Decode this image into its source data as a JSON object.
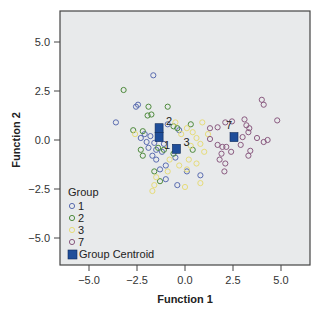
{
  "chart_data": {
    "type": "scatter",
    "title": "",
    "xlabel": "Function 1",
    "ylabel": "Function 2",
    "xlim": [
      -6.5,
      6.5
    ],
    "ylim": [
      -6.5,
      6.5
    ],
    "xticks": [
      -5.0,
      -2.5,
      0.0,
      2.5,
      5.0
    ],
    "yticks": [
      -5.0,
      -2.5,
      0.0,
      2.5,
      5.0
    ],
    "xtick_labels": [
      "−5.0",
      "−2.5",
      "0.0",
      "2.5",
      "5.0"
    ],
    "ytick_labels": [
      "−5.0",
      "−2.5",
      "0.0",
      "2.5",
      "5.0"
    ],
    "grid": false,
    "plot_background": "#e8eaeb",
    "legend": {
      "title": "Group",
      "position": "lower-left-inside",
      "entries": [
        {
          "label": "1",
          "color": "#5a6cb0",
          "marker": "open-circle"
        },
        {
          "label": "2",
          "color": "#4e8a3c",
          "marker": "open-circle"
        },
        {
          "label": "3",
          "color": "#e6dc7a",
          "marker": "open-circle"
        },
        {
          "label": "7",
          "color": "#8a5a80",
          "marker": "open-circle"
        },
        {
          "label": "Group Centroid",
          "color": "#1f4e9a",
          "marker": "filled-square"
        }
      ]
    },
    "series": [
      {
        "name": "1",
        "color": "#5a6cb0",
        "points": [
          [
            -1.65,
            3.3
          ],
          [
            -2.45,
            1.8
          ],
          [
            -2.55,
            1.7
          ],
          [
            -3.6,
            0.9
          ],
          [
            -2.1,
            0.3
          ],
          [
            -1.8,
            0.2
          ],
          [
            -2.0,
            -0.1
          ],
          [
            -1.6,
            -0.15
          ],
          [
            -1.9,
            -0.4
          ],
          [
            -1.5,
            -0.5
          ],
          [
            -1.2,
            -0.6
          ],
          [
            -1.7,
            -0.8
          ],
          [
            -1.5,
            -1.0
          ],
          [
            -1.0,
            -1.3
          ],
          [
            -0.5,
            -0.9
          ],
          [
            -1.3,
            -1.5
          ],
          [
            -1.0,
            -2.0
          ],
          [
            0.1,
            -1.6
          ],
          [
            -0.4,
            -2.3
          ],
          [
            -0.3,
            0.5
          ],
          [
            -0.9,
            0.8
          ],
          [
            -1.1,
            -0.2
          ],
          [
            0.8,
            -1.8
          ],
          [
            -2.3,
            0.1
          ]
        ]
      },
      {
        "name": "2",
        "color": "#4e8a3c",
        "points": [
          [
            -3.2,
            2.55
          ],
          [
            -1.9,
            1.7
          ],
          [
            -0.9,
            1.7
          ],
          [
            -1.95,
            1.25
          ],
          [
            -1.75,
            1.3
          ],
          [
            -2.7,
            0.5
          ],
          [
            -2.2,
            0.45
          ],
          [
            -0.6,
            0.7
          ],
          [
            -0.4,
            0.6
          ],
          [
            -1.4,
            -0.4
          ],
          [
            -2.2,
            -0.8
          ],
          [
            -1.1,
            -0.5
          ],
          [
            -0.6,
            -0.7
          ],
          [
            -1.6,
            -1.6
          ],
          [
            0.3,
            0.8
          ],
          [
            -1.3,
            -2.1
          ],
          [
            0.4,
            -0.5
          ],
          [
            -2.3,
            -0.5
          ]
        ]
      },
      {
        "name": "3",
        "color": "#e6dc7a",
        "points": [
          [
            0.1,
            0.6
          ],
          [
            0.4,
            0.4
          ],
          [
            -0.2,
            0.3
          ],
          [
            0.6,
            0.1
          ],
          [
            0.8,
            -0.2
          ],
          [
            0.3,
            -0.3
          ],
          [
            -0.5,
            0.9
          ],
          [
            0.9,
            0.9
          ],
          [
            -0.8,
            -1.0
          ],
          [
            0.2,
            -1.0
          ],
          [
            0.6,
            -1.2
          ],
          [
            0.1,
            -1.5
          ],
          [
            -0.9,
            -1.6
          ],
          [
            -1.6,
            -2.3
          ],
          [
            -1.7,
            -2.6
          ],
          [
            0.0,
            -2.4
          ],
          [
            0.8,
            -2.2
          ],
          [
            -0.3,
            -1.3
          ],
          [
            1.0,
            -0.6
          ],
          [
            -2.6,
            0.3
          ],
          [
            1.2,
            0.3
          ],
          [
            -1.5,
            -1.9
          ]
        ]
      },
      {
        "name": "7",
        "color": "#8a5a80",
        "points": [
          [
            4.0,
            2.05
          ],
          [
            4.1,
            1.8
          ],
          [
            4.8,
            1.0
          ],
          [
            1.3,
            0.6
          ],
          [
            1.7,
            0.65
          ],
          [
            2.1,
            0.9
          ],
          [
            2.45,
            0.95
          ],
          [
            3.1,
            1.05
          ],
          [
            3.2,
            0.75
          ],
          [
            3.35,
            0.6
          ],
          [
            3.3,
            0.4
          ],
          [
            1.3,
            0.05
          ],
          [
            3.0,
            0.15
          ],
          [
            3.75,
            0.1
          ],
          [
            4.1,
            -0.1
          ],
          [
            4.3,
            0.0
          ],
          [
            1.7,
            -0.25
          ],
          [
            1.95,
            -0.35
          ],
          [
            2.15,
            -0.35
          ],
          [
            1.9,
            -0.7
          ],
          [
            2.4,
            -0.6
          ],
          [
            2.9,
            -0.25
          ],
          [
            3.3,
            -0.8
          ],
          [
            1.8,
            -1.0
          ],
          [
            2.1,
            -1.2
          ],
          [
            2.05,
            -1.6
          ],
          [
            3.4,
            -0.55
          ]
        ]
      }
    ],
    "centroids": [
      {
        "group": "1",
        "x": -1.35,
        "y": 0.15,
        "label": "1"
      },
      {
        "group": "2",
        "x": -1.35,
        "y": 0.6,
        "label": "2"
      },
      {
        "group": "3",
        "x": -0.45,
        "y": -0.45,
        "label": "3"
      },
      {
        "group": "7",
        "x": 2.55,
        "y": 0.15,
        "label": "7"
      }
    ]
  },
  "axes": {
    "x_title": "Function 1",
    "y_title": "Function 2"
  },
  "legend": {
    "title": "Group",
    "items": [
      {
        "label": "1"
      },
      {
        "label": "2"
      },
      {
        "label": "3"
      },
      {
        "label": "7"
      },
      {
        "label": "Group Centroid"
      }
    ]
  },
  "colors": {
    "group_1": "#5a6cb0",
    "group_2": "#4e8a3c",
    "group_3": "#e6dc7a",
    "group_7": "#8a5a80",
    "centroid": "#1f4e9a",
    "plot_bg": "#e8eaeb"
  }
}
